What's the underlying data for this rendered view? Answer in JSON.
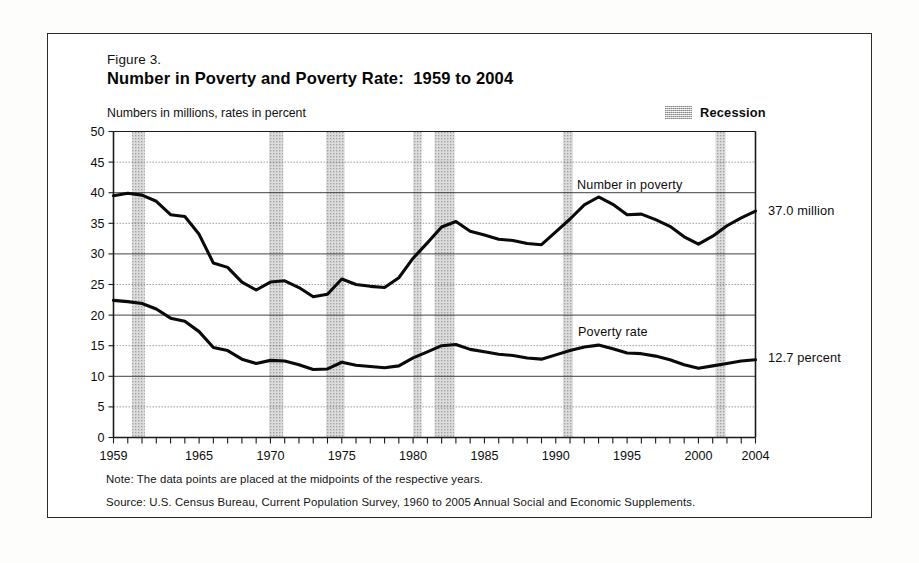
{
  "figure": {
    "label": "Figure 3.",
    "title": "Number in Poverty and Poverty Rate:  1959 to 2004",
    "axis_note": "Numbers in millions, rates in percent"
  },
  "legend": {
    "recession_label": "Recession",
    "recession_color": "#d2d2d2"
  },
  "series_labels": {
    "number": "Number in poverty",
    "rate": "Poverty rate"
  },
  "annotations": {
    "number_end": "37.0 million",
    "rate_end": "12.7 percent"
  },
  "footnotes": {
    "note": "Note:  The data points are placed at the midpoints of the respective years.",
    "source": "Source:  U.S. Census Bureau, Current Population Survey, 1960 to 2005 Annual Social and Economic Supplements."
  },
  "chart_data": {
    "type": "line",
    "title": "Number in Poverty and Poverty Rate:  1959 to 2004",
    "subtitle": "Numbers in millions, rates in percent",
    "xlabel": "",
    "ylabel": "",
    "xlim": [
      1959,
      2004
    ],
    "ylim": [
      0,
      50
    ],
    "ytick_step": 5,
    "yticks": [
      0,
      5,
      10,
      15,
      20,
      25,
      30,
      35,
      40,
      45,
      50
    ],
    "xticks_labeled": [
      1959,
      1965,
      1970,
      1975,
      1980,
      1985,
      1990,
      1995,
      2000,
      2004
    ],
    "xtick_minor_step": 1,
    "grid": "horizontal",
    "legend_position": "top-right",
    "x": [
      1959,
      1960,
      1961,
      1962,
      1963,
      1964,
      1965,
      1966,
      1967,
      1968,
      1969,
      1970,
      1971,
      1972,
      1973,
      1974,
      1975,
      1976,
      1977,
      1978,
      1979,
      1980,
      1981,
      1982,
      1983,
      1984,
      1985,
      1986,
      1987,
      1988,
      1989,
      1990,
      1991,
      1992,
      1993,
      1994,
      1995,
      1996,
      1997,
      1998,
      1999,
      2000,
      2001,
      2002,
      2003,
      2004
    ],
    "series": [
      {
        "name": "Number in poverty",
        "unit": "millions",
        "end_value": 37.0,
        "values": [
          39.5,
          39.9,
          39.6,
          38.6,
          36.4,
          36.1,
          33.2,
          28.5,
          27.8,
          25.4,
          24.1,
          25.4,
          25.6,
          24.5,
          23.0,
          23.4,
          25.9,
          25.0,
          24.7,
          24.5,
          26.1,
          29.3,
          31.8,
          34.4,
          35.3,
          33.7,
          33.1,
          32.4,
          32.2,
          31.7,
          31.5,
          33.6,
          35.7,
          38.0,
          39.3,
          38.1,
          36.4,
          36.5,
          35.6,
          34.5,
          32.8,
          31.6,
          32.9,
          34.6,
          35.9,
          37.0
        ]
      },
      {
        "name": "Poverty rate",
        "unit": "percent",
        "end_value": 12.7,
        "values": [
          22.4,
          22.2,
          21.9,
          21.0,
          19.5,
          19.0,
          17.3,
          14.7,
          14.2,
          12.8,
          12.1,
          12.6,
          12.5,
          11.9,
          11.1,
          11.2,
          12.3,
          11.8,
          11.6,
          11.4,
          11.7,
          13.0,
          14.0,
          15.0,
          15.2,
          14.4,
          14.0,
          13.6,
          13.4,
          13.0,
          12.8,
          13.5,
          14.2,
          14.8,
          15.1,
          14.5,
          13.8,
          13.7,
          13.3,
          12.7,
          11.9,
          11.3,
          11.7,
          12.1,
          12.5,
          12.7
        ]
      }
    ],
    "recessions": [
      {
        "start": 1960.3,
        "end": 1961.2
      },
      {
        "start": 1969.9,
        "end": 1970.9
      },
      {
        "start": 1973.9,
        "end": 1975.2
      },
      {
        "start": 1980.0,
        "end": 1980.6
      },
      {
        "start": 1981.5,
        "end": 1982.9
      },
      {
        "start": 1990.5,
        "end": 1991.2
      },
      {
        "start": 2001.2,
        "end": 2001.9
      }
    ]
  }
}
